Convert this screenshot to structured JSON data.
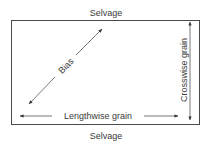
{
  "diagram": {
    "labels": {
      "selvage_top": "Selvage",
      "selvage_bottom": "Selvage",
      "bias": "Bias",
      "lengthwise": "Lengthwise grain",
      "crosswise": "Crosswise grain"
    },
    "colors": {
      "line": "#4a4a4a",
      "text": "#3a3a3a",
      "background": "#ffffff"
    }
  }
}
